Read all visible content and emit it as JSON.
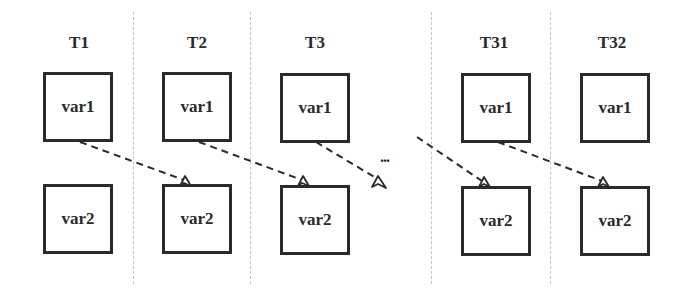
{
  "diagram": {
    "columns": [
      {
        "label": "T1",
        "top_node": "var1",
        "bottom_node": "var2"
      },
      {
        "label": "T2",
        "top_node": "var1",
        "bottom_node": "var2"
      },
      {
        "label": "T3",
        "top_node": "var1",
        "bottom_node": "var2"
      },
      {
        "label": "T31",
        "top_node": "var1",
        "bottom_node": "var2"
      },
      {
        "label": "T32",
        "top_node": "var1",
        "bottom_node": "var2"
      }
    ],
    "ellipsis": "...",
    "edges": [
      {
        "from": "T1.var1",
        "to": "T2.var2",
        "style": "dashed"
      },
      {
        "from": "T2.var1",
        "to": "T3.var2",
        "style": "dashed"
      },
      {
        "from": "T3.var1",
        "to": "...",
        "style": "dashed"
      },
      {
        "from": "...",
        "to": "T31.var2",
        "style": "dashed"
      },
      {
        "from": "T31.var1",
        "to": "T32.var2",
        "style": "dashed"
      }
    ],
    "colors": {
      "stroke": "#2a2a2a",
      "divider": "#c4c4c4",
      "background": "#ffffff"
    }
  }
}
